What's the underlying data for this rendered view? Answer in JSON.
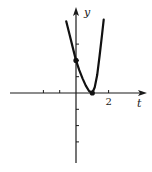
{
  "chart_data": {
    "type": "line",
    "title": "",
    "xlabel": "t",
    "ylabel": "y",
    "xlim": [
      -4,
      3.8
    ],
    "ylim": [
      -4.3,
      4.7
    ],
    "grid": false,
    "x_ticks": [
      -2,
      -1,
      1,
      2
    ],
    "y_ticks": [
      -3,
      -2,
      -1,
      1,
      2,
      3
    ],
    "x_tick_labels": [
      {
        "value": 2,
        "label": "2"
      }
    ],
    "series": [
      {
        "name": "curve",
        "x": [
          -0.6,
          -0.4,
          -0.2,
          0,
          0.2,
          0.4,
          0.6,
          0.8,
          1.0,
          1.15,
          1.3,
          1.45,
          1.6,
          1.7
        ],
        "y": [
          4.4,
          3.6,
          2.8,
          2.0,
          1.4,
          0.9,
          0.45,
          0.12,
          0,
          0.35,
          1.1,
          2.3,
          3.6,
          4.5
        ]
      }
    ],
    "points": [
      {
        "x": 0,
        "y": 2,
        "label": "y-intercept"
      },
      {
        "x": 1,
        "y": 0,
        "label": "vertex"
      }
    ]
  }
}
